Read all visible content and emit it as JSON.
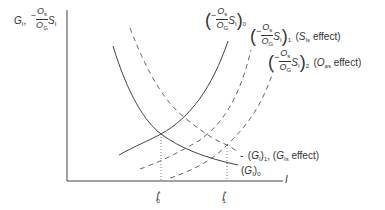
{
  "diagram": {
    "y_axis_label": {
      "g": "G",
      "g_sub": "I",
      "sep": ",",
      "minus": "−",
      "frac_num": "O",
      "frac_num_sub": "s",
      "frac_den": "O",
      "frac_den_sub": "G",
      "s": "S",
      "s_sub": "I"
    },
    "x_axis_label": "I",
    "ticks": [
      {
        "name": "I",
        "sub": "0",
        "sup": "*"
      },
      {
        "name": "I",
        "sub": "1",
        "sup": "*"
      }
    ],
    "curve_labels": {
      "s0": {
        "minus": "−",
        "num": "O",
        "num_sub": "s",
        "den": "O",
        "den_sub": "G",
        "s": "S",
        "s_sub": "I",
        "index": "0"
      },
      "s1": {
        "minus": "−",
        "num": "O",
        "num_sub": "s",
        "den": "O",
        "den_sub": "G",
        "s": "S",
        "s_sub": "I",
        "index": "1",
        "effect_open": "(",
        "effect_var": "S",
        "effect_sub": "Is",
        "effect_text": " effect)"
      },
      "s2": {
        "minus": "−",
        "num": "O",
        "num_sub": "s",
        "den": "O",
        "den_sub": "G",
        "s": "S",
        "s_sub": "I",
        "index": "2",
        "effect_open": "(",
        "effect_var": "O",
        "effect_sub": "as",
        "effect_text": " effect)"
      },
      "g1": {
        "dash": "-",
        "open": "(",
        "g": "G",
        "g_sub": "I",
        "close": ")",
        "index": "1",
        "sep": ", ",
        "effect_open": "(",
        "effect_var": "G",
        "effect_sub": "Is",
        "effect_text": " effect)"
      },
      "g0": {
        "open": "(",
        "g": "G",
        "g_sub": "I",
        "close": ")",
        "index": "0"
      }
    },
    "colors": {
      "line": "#444444",
      "dashed": "#666666",
      "dotted": "#555555"
    }
  }
}
